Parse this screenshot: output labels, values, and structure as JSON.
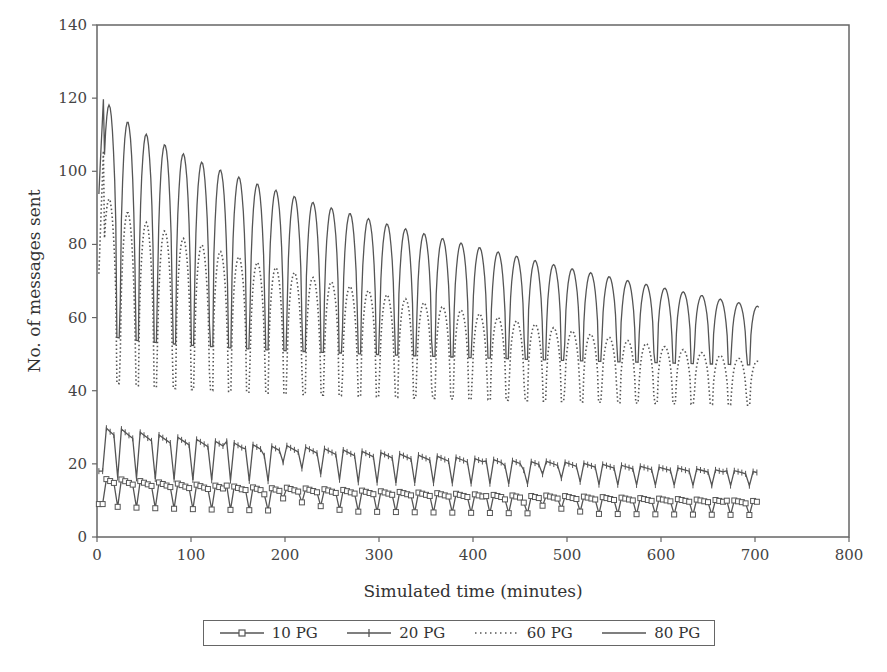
{
  "chart_data": {
    "type": "line",
    "title": "",
    "xlabel": "Simulated time (minutes)",
    "ylabel": "No. of messages sent",
    "xlim": [
      0,
      800
    ],
    "ylim": [
      0,
      140
    ],
    "xticks": [
      0,
      100,
      200,
      300,
      400,
      500,
      600,
      700,
      800
    ],
    "yticks": [
      0,
      20,
      40,
      60,
      80,
      100,
      120,
      140
    ],
    "grid": false,
    "legend_position": "bottom",
    "period_minutes": 20,
    "series": [
      {
        "name": "10 PG",
        "style": "solid-square-markers",
        "x": [
          0,
          5,
          10,
          20,
          25,
          30,
          40,
          45,
          50,
          60,
          65,
          70,
          80,
          85,
          90,
          100,
          120,
          140,
          160,
          180,
          200,
          250,
          300,
          350,
          400,
          450,
          500,
          550,
          600,
          650,
          700,
          705
        ],
        "values": [
          9,
          9,
          17,
          17,
          8,
          16,
          15,
          9,
          14,
          13,
          8,
          13,
          12,
          9,
          12,
          12,
          11,
          11,
          11,
          11,
          11,
          10,
          10,
          10,
          10,
          10,
          9,
          9,
          9,
          9,
          9,
          9
        ],
        "peak_start": 17,
        "peak_end": 10,
        "trough_start": 9,
        "trough_end": 6
      },
      {
        "name": "20 PG",
        "style": "solid-plus-markers",
        "x": [
          0,
          5,
          10,
          20,
          25,
          30,
          40,
          45,
          50,
          60,
          70,
          80,
          100,
          150,
          200,
          250,
          300,
          350,
          400,
          450,
          500,
          550,
          600,
          650,
          700,
          705
        ],
        "values": [
          18,
          18,
          32,
          30,
          17,
          29,
          28,
          16,
          27,
          26,
          16,
          25,
          24,
          23,
          22,
          21,
          21,
          20,
          20,
          19,
          19,
          19,
          19,
          18,
          17,
          16
        ],
        "peak_start": 32,
        "peak_end": 18,
        "trough_start": 17,
        "trough_end": 14
      },
      {
        "name": "60 PG",
        "style": "dotted",
        "x": [
          0,
          5,
          10,
          15,
          20,
          25,
          30,
          40,
          45,
          50,
          60,
          70,
          80,
          85,
          90,
          100,
          150,
          200,
          250,
          300,
          350,
          400,
          450,
          500,
          550,
          600,
          650,
          700,
          705
        ],
        "values": [
          58,
          93,
          98,
          90,
          87,
          44,
          80,
          73,
          38,
          72,
          67,
          64,
          62,
          35,
          61,
          60,
          58,
          56,
          55,
          54,
          52,
          51,
          50,
          49,
          48,
          48,
          48,
          48,
          46
        ],
        "peak_start": 98,
        "peak_end": 48,
        "trough_start": 44,
        "trough_end": 36
      },
      {
        "name": "80 PG",
        "style": "solid",
        "x": [
          0,
          5,
          10,
          15,
          20,
          25,
          30,
          40,
          45,
          50,
          60,
          70,
          80,
          90,
          100,
          120,
          140,
          160,
          180,
          200,
          250,
          300,
          350,
          400,
          450,
          500,
          550,
          600,
          650,
          700,
          705
        ],
        "values": [
          83,
          110,
          125,
          115,
          108,
          57,
          103,
          96,
          56,
          95,
          91,
          87,
          85,
          50,
          86,
          84,
          82,
          81,
          80,
          79,
          76,
          75,
          72,
          69,
          67,
          65,
          65,
          64,
          64,
          63,
          61
        ],
        "peak_start": 125,
        "peak_end": 63,
        "trough_start": 57,
        "trough_end": 47
      }
    ]
  },
  "legend": {
    "items": [
      {
        "label": "10 PG",
        "marker": "square-marker"
      },
      {
        "label": "20 PG",
        "marker": "plus-marker"
      },
      {
        "label": "60 PG",
        "marker": "dotted-line"
      },
      {
        "label": "80 PG",
        "marker": "solid-line"
      }
    ]
  },
  "colors": {
    "line": "#555555",
    "axis": "#666666",
    "text": "#333333"
  }
}
